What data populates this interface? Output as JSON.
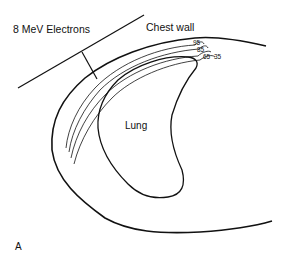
{
  "figure": {
    "beam_label": "8 MeV Electrons",
    "region_label": "Chest wall",
    "organ_label": "Lung",
    "panel_label": "A",
    "isodose_labels": [
      "95",
      "85",
      "65",
      "35"
    ],
    "line_color": "#111111",
    "background": "#ffffff"
  }
}
